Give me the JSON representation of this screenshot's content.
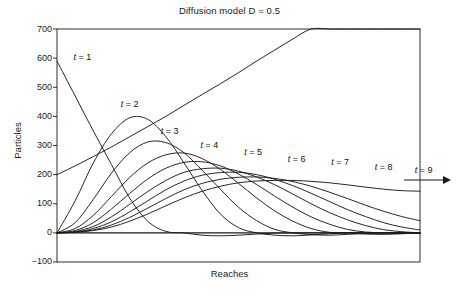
{
  "chart_data": {
    "type": "line",
    "title": "Diffusion model D = 0.5",
    "xlabel": "Reaches",
    "ylabel": "Particles",
    "ylim": [
      -100,
      700
    ],
    "xlim": [
      0,
      100
    ],
    "yticks": [
      700,
      600,
      500,
      400,
      300,
      200,
      100,
      0,
      -100
    ],
    "ytick_labels": [
      "700",
      "600",
      "500",
      "400",
      "300",
      "200",
      "100",
      "0",
      "−100"
    ],
    "xticks": [],
    "grid": false,
    "legend_position": "inline-annotations",
    "frame": "box",
    "annotations": [
      {
        "label": "t = 1",
        "x": 4,
        "y": 600
      },
      {
        "label": "t = 2",
        "x": 17,
        "y": 440
      },
      {
        "label": "t = 3",
        "x": 28,
        "y": 345
      },
      {
        "label": "t = 4",
        "x": 39,
        "y": 300
      },
      {
        "label": "t = 5",
        "x": 51,
        "y": 275
      },
      {
        "label": "t = 6",
        "x": 63,
        "y": 250
      },
      {
        "label": "t = 7",
        "x": 75,
        "y": 240
      },
      {
        "label": "t = 8",
        "x": 87,
        "y": 222
      },
      {
        "label": "t = 9",
        "x": 98,
        "y": 212
      },
      {
        "label": "arrow-right",
        "x": 103,
        "y": 178
      }
    ],
    "series": [
      {
        "name": "t = 1",
        "peak_value": 590,
        "peak_x": 0,
        "values": [
          590,
          470,
          350,
          235,
          120,
          40,
          5,
          0,
          -8,
          -10,
          -8,
          -4,
          -1,
          0,
          0,
          0,
          0,
          0,
          0,
          0,
          0
        ]
      },
      {
        "name": "t = 2",
        "peak_value": 400,
        "peak_x": 19,
        "values": [
          0,
          110,
          240,
          340,
          395,
          390,
          330,
          240,
          145,
          65,
          18,
          0,
          -8,
          -10,
          -7,
          -3,
          0,
          0,
          0,
          0,
          0
        ]
      },
      {
        "name": "t = 3",
        "peak_value": 315,
        "peak_x": 29,
        "values": [
          0,
          35,
          115,
          205,
          275,
          312,
          310,
          275,
          215,
          150,
          88,
          42,
          12,
          0,
          -6,
          -8,
          -5,
          -2,
          0,
          0,
          0
        ]
      },
      {
        "name": "t = 4",
        "peak_value": 275,
        "peak_x": 39,
        "values": [
          0,
          15,
          60,
          125,
          190,
          240,
          268,
          274,
          255,
          218,
          170,
          120,
          75,
          40,
          15,
          2,
          0,
          -4,
          -5,
          -3,
          0
        ]
      },
      {
        "name": "t = 5",
        "peak_value": 245,
        "peak_x": 49,
        "values": [
          0,
          8,
          35,
          82,
          135,
          185,
          222,
          242,
          244,
          230,
          202,
          166,
          126,
          88,
          55,
          30,
          12,
          3,
          0,
          -2,
          0
        ]
      },
      {
        "name": "t = 6",
        "peak_value": 222,
        "peak_x": 58,
        "values": [
          0,
          5,
          22,
          55,
          98,
          142,
          180,
          208,
          220,
          222,
          212,
          192,
          165,
          133,
          100,
          70,
          45,
          25,
          11,
          4,
          0
        ]
      },
      {
        "name": "t = 7",
        "peak_value": 208,
        "peak_x": 68,
        "values": [
          0,
          3,
          15,
          38,
          72,
          110,
          148,
          178,
          198,
          207,
          208,
          200,
          184,
          162,
          136,
          108,
          80,
          56,
          35,
          20,
          10
        ]
      },
      {
        "name": "t = 8",
        "peak_value": 192,
        "peak_x": 80,
        "values": [
          0,
          2,
          10,
          27,
          53,
          85,
          118,
          148,
          170,
          184,
          191,
          192,
          187,
          176,
          160,
          140,
          118,
          95,
          74,
          56,
          42
        ]
      },
      {
        "name": "t = 9",
        "peak_value": 180,
        "peak_x": 93,
        "values": [
          0,
          2,
          8,
          20,
          40,
          65,
          93,
          120,
          143,
          160,
          172,
          178,
          180,
          180,
          177,
          172,
          165,
          157,
          150,
          145,
          143
        ]
      },
      {
        "name": "baseline",
        "peak_value": 0,
        "peak_x": 0,
        "values": [
          0,
          0,
          0,
          0,
          0,
          0,
          0,
          0,
          0,
          0,
          0,
          0,
          0,
          0,
          0,
          0,
          0,
          0,
          0,
          0,
          0
        ]
      },
      {
        "name": "rising-line",
        "peak_value": 200,
        "peak_x": 0,
        "values": [
          200,
          230,
          262,
          295,
          330,
          365,
          400,
          438,
          475,
          512,
          550,
          590,
          628,
          666,
          700,
          700,
          700,
          700,
          700,
          700,
          700
        ]
      }
    ]
  },
  "colors": {
    "line": "#1a1a1a",
    "axis": "#1a1a1a",
    "background": "#ffffff",
    "text": "#1a1a1a"
  }
}
